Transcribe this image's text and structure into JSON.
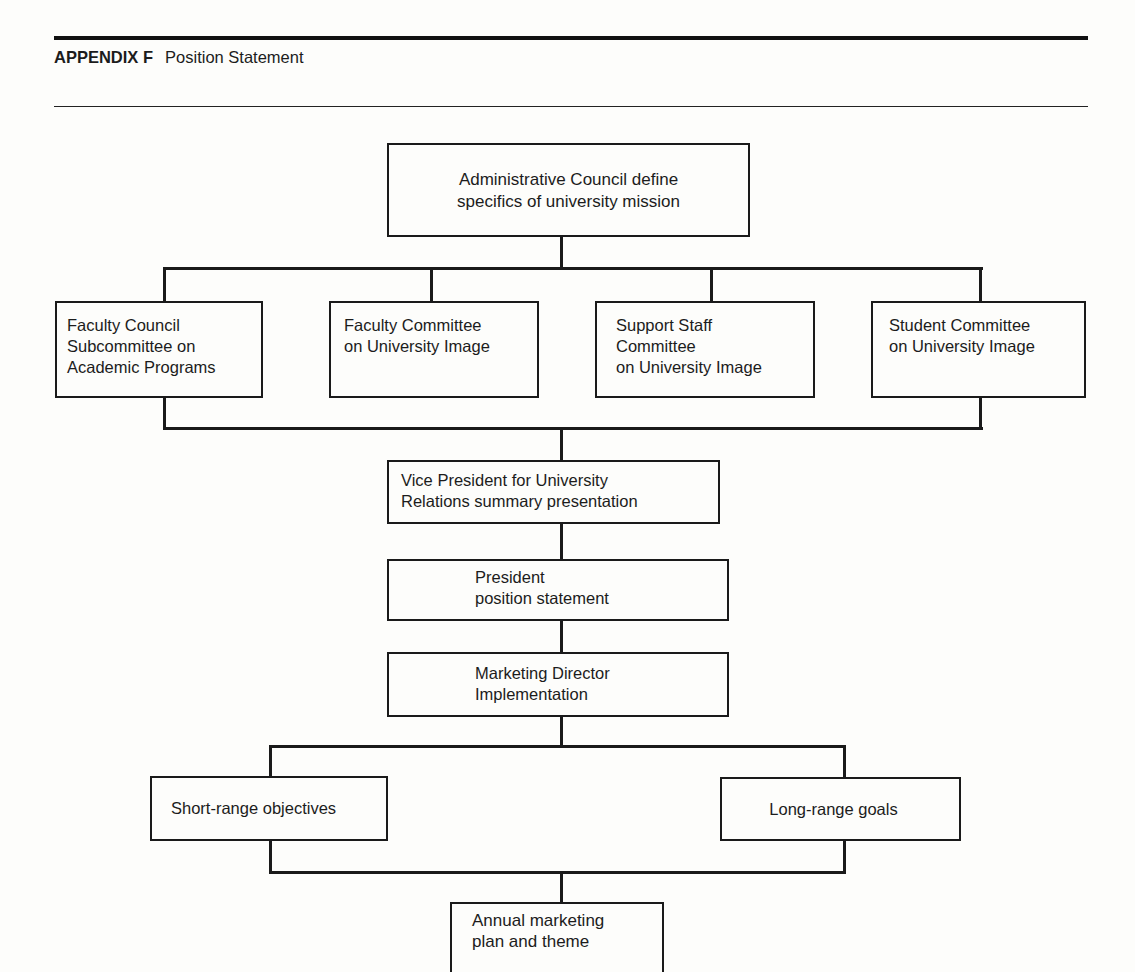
{
  "header": {
    "label": "APPENDIX F",
    "title": "Position Statement"
  },
  "diagram": {
    "top": "Administrative Council define\nspecifics of university mission",
    "committees": [
      "Faculty Council\nSubcommittee on\nAcademic Programs",
      "Faculty Committee\non University Image",
      "Support Staff\nCommittee\non University Image",
      "Student Committee\non University Image"
    ],
    "vice_president": "Vice President for University\nRelations summary presentation",
    "president": "President\nposition statement",
    "marketing_director": "Marketing Director\nImplementation",
    "outcomes": [
      "Short-range objectives",
      "Long-range goals"
    ],
    "annual_plan": "Annual marketing\nplan and theme"
  }
}
